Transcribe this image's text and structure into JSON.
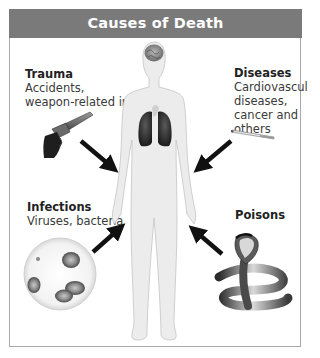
{
  "title": "Causes of Death",
  "categories": [
    {
      "id": "trauma",
      "title": "Trauma",
      "description_lines": [
        "Accidents,",
        "weapon-related injuries"
      ],
      "illustration": "revolver-icon"
    },
    {
      "id": "diseases",
      "title": "Diseases",
      "description_lines": [
        "Cardiovascular",
        "diseases,",
        "cancer and",
        "others"
      ],
      "illustration": "cigarette-icon"
    },
    {
      "id": "infections",
      "title": "Infections",
      "description_lines": [
        "Viruses, bacteria"
      ],
      "illustration": "petri-dish-bacteria-icon"
    },
    {
      "id": "poisons",
      "title": "Poisons",
      "description_lines": [],
      "illustration": "cobra-snake-icon"
    }
  ],
  "center_figure": "human-body-silhouette",
  "colors": {
    "header_bg": "#7a7a7a",
    "header_text": "#ffffff",
    "border": "#a9a9a9",
    "body_fill": "#e8e8e8",
    "arrow": "#111111"
  }
}
